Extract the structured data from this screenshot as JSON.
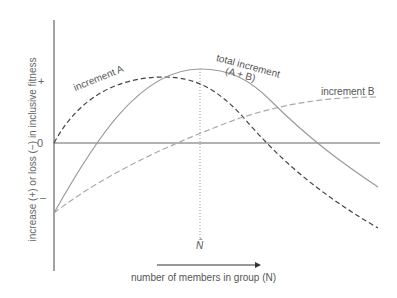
{
  "diagram": {
    "y_axis_label": "increase (+) or loss (−) in inclusive fitness",
    "y_ticks": {
      "plus": "+",
      "zero": "0",
      "minus": "–"
    },
    "x_axis_label": "number of members in group (N)",
    "n_hat_label": "N̂",
    "curves": {
      "increment_a": "increment A",
      "increment_b": "increment B",
      "total_line1": "total increment",
      "total_line2": "(A + B)"
    },
    "colors": {
      "axis": "#666666",
      "increment_a": "#444444",
      "increment_b": "#aaaaaa",
      "total": "#999999"
    }
  }
}
